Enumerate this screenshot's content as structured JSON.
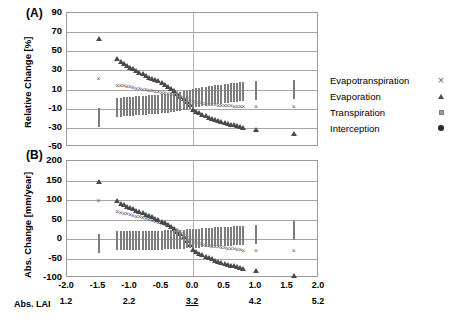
{
  "figure": {
    "panel_a_tag": "(A)",
    "panel_b_tag": "(B)",
    "lai_axis_label": "Abs. LAI"
  },
  "legend": {
    "position": "right",
    "items": [
      {
        "label": "Evapotranspiration",
        "marker": "cross-marker",
        "color": "#5f5f5f"
      },
      {
        "label": "Evaporation",
        "marker": "triangle-marker",
        "color": "#4a4a4a"
      },
      {
        "label": "Transpiration",
        "marker": "square-marker",
        "color": "#9e9e9e"
      },
      {
        "label": "Interception",
        "marker": "circle-marker",
        "color": "#2e2e2e"
      }
    ]
  },
  "chart_data": [
    {
      "type": "scatter",
      "panel": "(A)",
      "title": "",
      "xlabel": "",
      "ylabel": "Relative Change [%]",
      "ylim": [
        -50,
        90
      ],
      "yticks": [
        -50,
        -30,
        -10,
        10,
        30,
        50,
        70,
        90
      ],
      "xlim": [
        -2.0,
        2.0
      ],
      "xticks": [
        -2.0,
        -1.5,
        -1.0,
        -0.5,
        0.0,
        0.5,
        1.0,
        1.5,
        2.0
      ],
      "xtick_labels": [
        "-2.0",
        "-1.5",
        "-1.0",
        "-0.5",
        "0.0",
        "0.5",
        "1.0",
        "1.5",
        "2.0"
      ],
      "secondary_xticks": [
        -2.0,
        -1.0,
        0.0,
        1.0,
        2.0
      ],
      "secondary_xtick_labels": [
        "1.2",
        "2.2",
        "3.2",
        "4.2",
        "5.2"
      ],
      "secondary_xtick_emphasis": "3.2",
      "grid": true,
      "reference_line_x": 0.0,
      "x": [
        -1.5,
        -1.2,
        -1.15,
        -1.1,
        -1.05,
        -1.0,
        -0.95,
        -0.9,
        -0.85,
        -0.8,
        -0.75,
        -0.7,
        -0.65,
        -0.6,
        -0.55,
        -0.5,
        -0.45,
        -0.4,
        -0.35,
        -0.3,
        -0.25,
        -0.2,
        -0.15,
        -0.1,
        -0.05,
        0.0,
        0.05,
        0.1,
        0.15,
        0.2,
        0.25,
        0.3,
        0.35,
        0.4,
        0.45,
        0.5,
        0.55,
        0.6,
        0.65,
        0.7,
        0.75,
        0.8,
        1.0,
        1.6
      ],
      "series": [
        {
          "name": "Evapotranspiration",
          "marker": "cross-marker",
          "values": [
            24,
            17,
            17,
            17,
            16,
            16,
            15,
            14,
            14,
            13,
            13,
            12,
            12,
            11,
            11,
            10,
            10,
            9,
            8,
            7,
            6,
            5,
            4,
            3,
            2,
            0,
            -1,
            -1,
            -2,
            -2,
            -3,
            -3,
            -3,
            -4,
            -4,
            -4,
            -4,
            -4,
            -5,
            -5,
            -5,
            -5,
            -5,
            -5
          ]
        },
        {
          "name": "Evaporation",
          "marker": "triangle-marker",
          "values": [
            74,
            53,
            50,
            48,
            46,
            44,
            43,
            41,
            39,
            38,
            36,
            34,
            33,
            31,
            30,
            28,
            26,
            24,
            22,
            20,
            17,
            14,
            12,
            9,
            5,
            0,
            -2,
            -3,
            -5,
            -6,
            -8,
            -9,
            -10,
            -11,
            -12,
            -13,
            -14,
            -15,
            -16,
            -17,
            -18,
            -19,
            -21,
            -25
          ]
        },
        {
          "name": "Transpiration",
          "marker": "square-marker",
          "values": [
            -20,
            -9,
            -9,
            -8,
            -8,
            -8,
            -8,
            -7,
            -7,
            -7,
            -7,
            -6,
            -6,
            -6,
            -6,
            -5,
            -5,
            -5,
            -4,
            -4,
            -3,
            -3,
            -2,
            -2,
            -1,
            0,
            1,
            1,
            2,
            2,
            3,
            3,
            4,
            4,
            4,
            5,
            5,
            6,
            6,
            6,
            7,
            7,
            8,
            10
          ]
        },
        {
          "name": "Interception",
          "marker": "circle-marker",
          "values": [
            -44,
            -32,
            -31,
            -30,
            -29,
            -28,
            -27,
            -26,
            -25,
            -24,
            -23,
            -22,
            -21,
            -20,
            -19,
            -18,
            -17,
            -15,
            -14,
            -12,
            -10,
            -9,
            -7,
            -5,
            -3,
            0,
            1,
            2,
            3,
            4,
            5,
            6,
            7,
            8,
            9,
            10,
            11,
            12,
            13,
            14,
            15,
            16,
            20,
            30
          ]
        }
      ]
    },
    {
      "type": "scatter",
      "panel": "(B)",
      "title": "",
      "xlabel": "",
      "ylabel": "Abs. Change [mm/year]",
      "ylim": [
        -100,
        200
      ],
      "yticks": [
        -100,
        -50,
        0,
        50,
        100,
        150,
        200
      ],
      "xlim": [
        -2.0,
        2.0
      ],
      "xticks": [
        -2.0,
        -1.5,
        -1.0,
        -0.5,
        0.0,
        0.5,
        1.0,
        1.5,
        2.0
      ],
      "xtick_labels": [
        "-2.0",
        "-1.5",
        "-1.0",
        "-0.5",
        "0.0",
        "0.5",
        "1.0",
        "1.5",
        "2.0"
      ],
      "secondary_xticks": [
        -2.0,
        -1.0,
        0.0,
        1.0,
        2.0
      ],
      "secondary_xtick_labels": [
        "1.2",
        "2.2",
        "3.2",
        "4.2",
        "5.2"
      ],
      "secondary_xtick_emphasis": "3.2",
      "grid": true,
      "reference_line_x": 0.0,
      "x": [
        -1.5,
        -1.2,
        -1.15,
        -1.1,
        -1.05,
        -1.0,
        -0.95,
        -0.9,
        -0.85,
        -0.8,
        -0.75,
        -0.7,
        -0.65,
        -0.6,
        -0.55,
        -0.5,
        -0.45,
        -0.4,
        -0.35,
        -0.3,
        -0.25,
        -0.2,
        -0.15,
        -0.1,
        -0.05,
        0.0,
        0.05,
        0.1,
        0.15,
        0.2,
        0.25,
        0.3,
        0.35,
        0.4,
        0.45,
        0.5,
        0.55,
        0.6,
        0.65,
        0.7,
        0.75,
        0.8,
        1.0,
        1.6
      ],
      "series": [
        {
          "name": "Evapotranspiration",
          "marker": "cross-marker",
          "values": [
            105,
            78,
            75,
            73,
            71,
            69,
            67,
            65,
            63,
            61,
            59,
            57,
            55,
            52,
            50,
            47,
            44,
            41,
            38,
            34,
            30,
            26,
            21,
            16,
            9,
            0,
            -3,
            -5,
            -7,
            -9,
            -10,
            -12,
            -13,
            -14,
            -15,
            -16,
            -17,
            -18,
            -19,
            -20,
            -21,
            -22,
            -23,
            -24
          ]
        },
        {
          "name": "Evaporation",
          "marker": "triangle-marker",
          "values": [
            175,
            125,
            119,
            115,
            111,
            107,
            104,
            100,
            97,
            94,
            90,
            87,
            84,
            80,
            77,
            73,
            69,
            64,
            59,
            53,
            47,
            40,
            33,
            24,
            13,
            0,
            -5,
            -9,
            -13,
            -17,
            -21,
            -24,
            -27,
            -30,
            -33,
            -35,
            -38,
            -40,
            -42,
            -44,
            -46,
            -48,
            -55,
            -66
          ]
        },
        {
          "name": "Transpiration",
          "marker": "square-marker",
          "values": [
            -13,
            -6,
            -6,
            -6,
            -6,
            -6,
            -5,
            -5,
            -5,
            -5,
            -5,
            -4,
            -4,
            -4,
            -4,
            -4,
            -3,
            -3,
            -3,
            -3,
            -2,
            -2,
            -2,
            -1,
            -1,
            0,
            1,
            1,
            2,
            2,
            3,
            3,
            4,
            4,
            5,
            5,
            6,
            6,
            7,
            7,
            8,
            8,
            11,
            20
          ]
        },
        {
          "name": "Interception",
          "marker": "circle-marker",
          "values": [
            -55,
            -41,
            -40,
            -39,
            -38,
            -37,
            -36,
            -35,
            -34,
            -33,
            -32,
            -31,
            -30,
            -29,
            -28,
            -26,
            -25,
            -23,
            -21,
            -19,
            -17,
            -14,
            -12,
            -9,
            -5,
            0,
            2,
            3,
            5,
            6,
            8,
            9,
            11,
            12,
            13,
            14,
            16,
            17,
            18,
            19,
            20,
            21,
            26,
            38
          ]
        }
      ]
    }
  ]
}
